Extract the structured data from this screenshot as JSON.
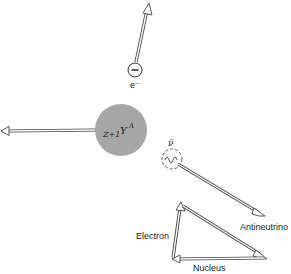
{
  "diagram": {
    "type": "beta-decay-momentum-diagram",
    "particles": {
      "electron": {
        "symbol": "e⁻",
        "charge_glyph": "−"
      },
      "nucleus": {
        "prefix": "Z+1",
        "symbol": "Y",
        "superscript": "A",
        "color": "#a6a6a6"
      },
      "antineutrino": {
        "symbol": "ν̄",
        "label": "Antineutrino"
      }
    },
    "triangle": {
      "labels": {
        "electron": "Electron",
        "nucleus": "Nucleus",
        "antineutrino": "Antineutrino"
      }
    }
  }
}
